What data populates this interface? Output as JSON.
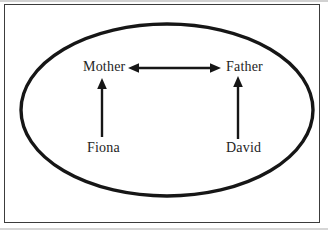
{
  "diagram": {
    "type": "family-system-diagram",
    "nodes": [
      {
        "id": "mother",
        "label": "Mother"
      },
      {
        "id": "father",
        "label": "Father"
      },
      {
        "id": "fiona",
        "label": "Fiona"
      },
      {
        "id": "david",
        "label": "David"
      }
    ],
    "edges": [
      {
        "from": "mother",
        "to": "father",
        "style": "double-headed-arrow",
        "direction": "bidirectional"
      },
      {
        "from": "fiona",
        "to": "mother",
        "style": "arrow",
        "direction": "up"
      },
      {
        "from": "david",
        "to": "father",
        "style": "arrow",
        "direction": "up"
      }
    ],
    "boundary": "ellipse",
    "colors": {
      "line": "#161616",
      "border": "#3c3c3c",
      "text": "#242424",
      "background": "#ffffff"
    }
  }
}
